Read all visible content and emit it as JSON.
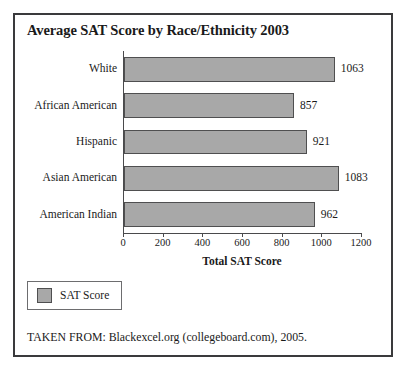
{
  "figure": {
    "title": "Average SAT Score by Race/Ethnicity 2003",
    "source_note": "TAKEN FROM: Blackexcel.org (collegeboard.com), 2005.",
    "frame_color": "#3a3a3c"
  },
  "legend": {
    "position": "below-plot-left",
    "swatch_color": "#a8a8a8",
    "label": "SAT Score"
  },
  "chart_data": {
    "type": "bar",
    "orientation": "horizontal",
    "title": "Average SAT Score by Race/Ethnicity 2003",
    "categories": [
      "White",
      "African American",
      "Hispanic",
      "Asian American",
      "American Indian"
    ],
    "values": [
      1063,
      857,
      921,
      1083,
      962
    ],
    "series": [
      {
        "name": "SAT Score",
        "values": [
          1063,
          857,
          921,
          1083,
          962
        ],
        "color": "#a8a8a8"
      }
    ],
    "data_labels": [
      "1063",
      "857",
      "921",
      "1083",
      "962"
    ],
    "xlabel": "Total SAT Score",
    "ylabel": "",
    "xlim": [
      0,
      1200
    ],
    "xticks": [
      0,
      200,
      400,
      600,
      800,
      1000,
      1200
    ],
    "xtick_labels": [
      "0",
      "200",
      "400",
      "600",
      "800",
      "1000",
      "1200"
    ],
    "grid": false,
    "legend_entries": [
      "SAT Score"
    ],
    "legend_position": "bottom-left"
  }
}
